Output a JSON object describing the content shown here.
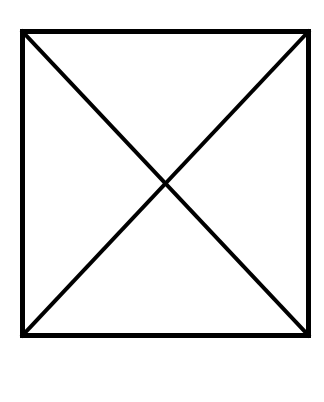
{
  "canvas": {
    "width": 324,
    "height": 402,
    "background_color": "#ffffff"
  },
  "figure": {
    "name": "square-with-diagonals",
    "stroke_color": "#000000",
    "fill_color": "none",
    "square": {
      "left": 22.5,
      "top": 31.5,
      "right": 308.5,
      "bottom": 335.5,
      "width": 286,
      "height": 304,
      "stroke_width": 5
    },
    "diagonals": [
      {
        "name": "diagonal-top-left-to-bottom-right",
        "x1": 22.5,
        "y1": 31.5,
        "x2": 308.5,
        "y2": 335.5,
        "stroke_width": 4
      },
      {
        "name": "diagonal-top-right-to-bottom-left",
        "x1": 308.5,
        "y1": 31.5,
        "x2": 22.5,
        "y2": 335.5,
        "stroke_width": 4
      }
    ],
    "intersection": {
      "x": 165.5,
      "y": 183.5
    }
  }
}
